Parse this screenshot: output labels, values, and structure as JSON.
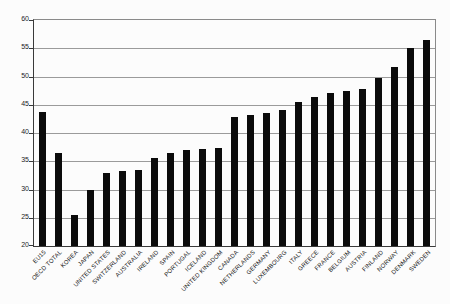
{
  "chart_data": {
    "type": "bar",
    "title": "",
    "xlabel": "",
    "ylabel": "",
    "categories": [
      "EU15",
      "OECD TOTAL",
      "KOREA",
      "JAPAN",
      "UNITED STATES",
      "SWITZERLAND",
      "AUSTRALIA",
      "IRELAND",
      "SPAIN",
      "PORTUGAL",
      "ICELAND",
      "UNITED KINGDOM",
      "CANADA",
      "NETHERLANDS",
      "GERMANY",
      "LUXEMBOURG",
      "ITALY",
      "GREECE",
      "FRANCE",
      "BELGIUM",
      "AUSTRIA",
      "FINLAND",
      "NORWAY",
      "DENMARK",
      "SWEDEN"
    ],
    "values": [
      43.8,
      36.5,
      25.4,
      30.0,
      33.0,
      33.2,
      33.4,
      35.5,
      36.4,
      37.0,
      37.1,
      37.4,
      42.8,
      43.2,
      43.6,
      44.0,
      45.5,
      46.4,
      47.0,
      47.4,
      47.8,
      49.7,
      51.7,
      55.1,
      56.4
    ],
    "ylim": [
      20,
      60
    ],
    "yticks": [
      20,
      25,
      30,
      35,
      40,
      45,
      50,
      55,
      60
    ],
    "grid": true,
    "legend": "none",
    "bar_color": "#0b0b0b",
    "gridline_color": "#9b9b9b",
    "axis_color": "#3a3a3a",
    "background_color": "#fcfcfc"
  }
}
